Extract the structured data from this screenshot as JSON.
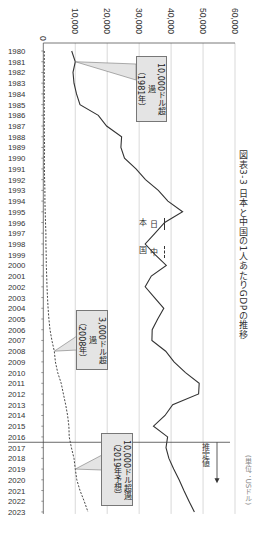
{
  "chart_data": {
    "type": "line",
    "orientation": "rotated-90-clockwise",
    "title": "図表3-3 日本と中国の1人あたりGDPの推移",
    "unit": "(単位：USドル)",
    "xlabel": "",
    "ylabel": "",
    "ylim": [
      0,
      60000
    ],
    "value_ticks": [
      "0",
      "10,000",
      "20,000",
      "30,000",
      "40,000",
      "50,000",
      "60,000"
    ],
    "tick_values": [
      0,
      10000,
      20000,
      30000,
      40000,
      50000,
      60000
    ],
    "grid": true,
    "x": [
      1980,
      1981,
      1982,
      1983,
      1984,
      1985,
      1986,
      1987,
      1988,
      1989,
      1990,
      1991,
      1992,
      1993,
      1994,
      1995,
      1996,
      1997,
      1998,
      1999,
      2000,
      2001,
      2002,
      2003,
      2004,
      2005,
      2006,
      2007,
      2008,
      2009,
      2010,
      2011,
      2012,
      2013,
      2014,
      2015,
      2016,
      2017,
      2018,
      2019,
      2020,
      2021,
      2022,
      2023
    ],
    "series": [
      {
        "name": "日本",
        "style": "solid",
        "values": [
          8900,
          10000,
          9300,
          9600,
          10400,
          11500,
          17200,
          19800,
          24500,
          24300,
          25400,
          29000,
          32000,
          36000,
          39000,
          43600,
          38000,
          35000,
          31900,
          35000,
          38500,
          33800,
          31900,
          34800,
          37700,
          35800,
          34100,
          34000,
          38300,
          40900,
          44500,
          48800,
          48600,
          40500,
          38100,
          34500,
          38900,
          38400,
          39300,
          40800,
          42500,
          44000,
          45600,
          47300
        ]
      },
      {
        "name": "中国",
        "style": "dashed",
        "values": [
          300,
          300,
          300,
          300,
          300,
          300,
          300,
          300,
          350,
          400,
          350,
          350,
          400,
          500,
          500,
          600,
          700,
          800,
          800,
          900,
          950,
          1050,
          1150,
          1300,
          1500,
          1750,
          2100,
          2700,
          3450,
          3800,
          4500,
          5600,
          6300,
          7000,
          7600,
          8000,
          8100,
          8800,
          9600,
          10000,
          10500,
          11500,
          12800,
          14000
        ]
      }
    ],
    "annotations": [
      {
        "series": "日本",
        "year": 1981,
        "line1": "10,000ドル超過",
        "line2": "（1981年）"
      },
      {
        "series": "中国",
        "year": 2008,
        "line1": "3,000ドル超過",
        "line2": "（2008年）"
      },
      {
        "series": "中国",
        "year": 2019,
        "line1": "10,000ドル超過",
        "line2": "（2019年予想）"
      }
    ],
    "estimate_divider_year": 2016.5,
    "estimate_label": "推定値",
    "legend": [
      {
        "label": "日本",
        "style": "solid"
      },
      {
        "label": "中国",
        "style": "dashed"
      }
    ],
    "legend_position": "bottom"
  }
}
